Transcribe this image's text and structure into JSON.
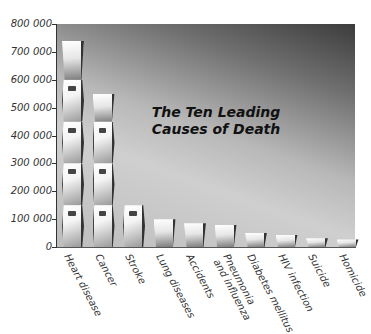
{
  "chart_data": {
    "type": "bar",
    "title": "The Ten Leading Causes of Death",
    "title_lines": [
      "The Ten Leading",
      "Causes of Death"
    ],
    "xlabel": "",
    "ylabel": "",
    "ylim": [
      0,
      800000
    ],
    "yticks": [
      "0",
      "100 000",
      "200 000",
      "300 000",
      "400 000",
      "500 000",
      "600 000",
      "700 000",
      "800 000"
    ],
    "grid": false,
    "legend": null,
    "categories": [
      "Heart disease",
      "Cancer",
      "Stroke",
      "Lung diseases",
      "Accidents",
      "Pneumonia and influenza",
      "Diabetes mellitus",
      "HIV infection",
      "Suicide",
      "Homicide"
    ],
    "category_lines": [
      [
        "Heart disease"
      ],
      [
        "Cancer"
      ],
      [
        "Stroke"
      ],
      [
        "Lung diseases"
      ],
      [
        "Accidents"
      ],
      [
        "Pneumonia",
        "and influenza"
      ],
      [
        "Diabetes mellitus"
      ],
      [
        "HIV infection"
      ],
      [
        "Suicide"
      ],
      [
        "Homicide"
      ]
    ],
    "values": [
      740000,
      550000,
      150000,
      100000,
      85000,
      80000,
      52000,
      43000,
      31000,
      27000
    ],
    "bar_style": "stacked coffin pictograms (each ~150 000)",
    "colors": {
      "background_dark": "#3c3c3c",
      "background_light": "#cfcfcf",
      "bar": "#f4f4f4",
      "outline": "#333333"
    }
  }
}
